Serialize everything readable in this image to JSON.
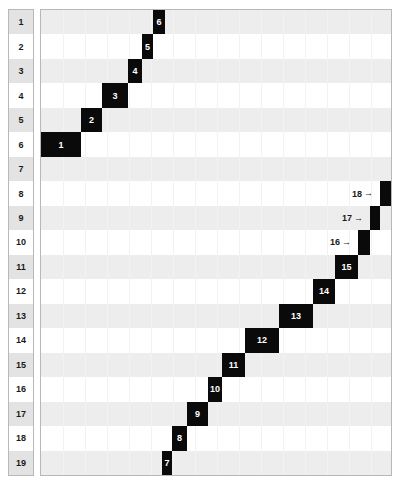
{
  "chart_data": {
    "type": "heatmap",
    "title": "",
    "xlabel": "",
    "ylabel": "",
    "grid": true,
    "legend": null,
    "rows": [
      "1",
      "2",
      "3",
      "4",
      "5",
      "6",
      "7",
      "8",
      "9",
      "10",
      "11",
      "12",
      "13",
      "14",
      "15",
      "16",
      "17",
      "18",
      "19"
    ],
    "row_count": 19,
    "note": "Anti-diagonal staircase of 18 filled black blocks; block n sits in a row and spans an x-interval. Blocks 16-18 are too narrow for an inside label, so their numbers are drawn to the left with a right arrow.",
    "x_axis_range": [
      0,
      352
    ],
    "blocks": [
      {
        "id": "1",
        "row": 6,
        "x": 0,
        "width": 40,
        "label_inside": true
      },
      {
        "id": "2",
        "row": 5,
        "x": 40,
        "width": 21,
        "label_inside": true
      },
      {
        "id": "3",
        "row": 4,
        "x": 61,
        "width": 26,
        "label_inside": true
      },
      {
        "id": "4",
        "row": 3,
        "x": 87,
        "width": 14,
        "label_inside": true
      },
      {
        "id": "5",
        "row": 2,
        "x": 101,
        "width": 11,
        "label_inside": true
      },
      {
        "id": "6",
        "row": 1,
        "x": 112,
        "width": 12,
        "label_inside": true
      },
      {
        "id": "7",
        "row": 19,
        "x": 121,
        "width": 10,
        "label_inside": true
      },
      {
        "id": "8",
        "row": 18,
        "x": 131,
        "width": 15,
        "label_inside": true
      },
      {
        "id": "9",
        "row": 17,
        "x": 146,
        "width": 21,
        "label_inside": true
      },
      {
        "id": "10",
        "row": 16,
        "x": 167,
        "width": 14,
        "label_inside": true
      },
      {
        "id": "11",
        "row": 15,
        "x": 181,
        "width": 23,
        "label_inside": true
      },
      {
        "id": "12",
        "row": 14,
        "x": 204,
        "width": 34,
        "label_inside": true
      },
      {
        "id": "13",
        "row": 13,
        "x": 238,
        "width": 34,
        "label_inside": true
      },
      {
        "id": "14",
        "row": 12,
        "x": 272,
        "width": 22,
        "label_inside": true
      },
      {
        "id": "15",
        "row": 11,
        "x": 294,
        "width": 23,
        "label_inside": true
      },
      {
        "id": "16",
        "row": 10,
        "x": 317,
        "width": 12,
        "label_inside": false
      },
      {
        "id": "17",
        "row": 9,
        "x": 329,
        "width": 10,
        "label_inside": false
      },
      {
        "id": "18",
        "row": 8,
        "x": 339,
        "width": 12,
        "label_inside": false
      }
    ],
    "external_labels": [
      {
        "id": "18",
        "text": "18",
        "arrow": "→",
        "row": 8,
        "right_edge_x": 339
      },
      {
        "id": "17",
        "text": "17",
        "arrow": "→",
        "row": 9,
        "right_edge_x": 329
      },
      {
        "id": "16",
        "text": "16",
        "arrow": "→",
        "row": 10,
        "right_edge_x": 317
      }
    ]
  },
  "colors": {
    "block_fill": "#0a0a0a",
    "block_text": "#ffffff",
    "band_odd": "#ededed",
    "band_even": "#ffffff",
    "row_header_odd": "#e3e3e3",
    "row_header_even": "#ffffff",
    "border": "#b8b8b8",
    "gridline": "#f2f2f2",
    "text": "#1a1a1a"
  }
}
